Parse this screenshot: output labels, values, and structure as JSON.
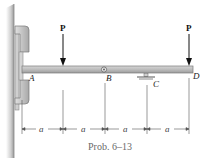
{
  "diagram": {
    "caption": "Prob. 6–13",
    "points": {
      "A": "A",
      "B": "B",
      "C": "C",
      "D": "D"
    },
    "loads": [
      {
        "label": "P",
        "position": "midway between A and B"
      },
      {
        "label": "P",
        "position": "at D"
      }
    ],
    "dimensions": [
      "a",
      "a",
      "a",
      "a"
    ],
    "supports": {
      "A": "fixed collar slider on vertical wall",
      "B": "pin (hinge)",
      "C": "roller support"
    },
    "colors": {
      "beam": "#b8b8b8",
      "beam_edge": "#7a7a7a",
      "wall": "#c8c8c8",
      "arrow": "#111111",
      "caption": "#6a6a6a"
    }
  }
}
